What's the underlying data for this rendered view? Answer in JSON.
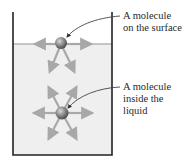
{
  "figure": {
    "labels": {
      "surface": {
        "line1": "A molecule",
        "line2": "on the surface"
      },
      "inside": {
        "line1": "A molecule",
        "line2": "inside the",
        "line3": "liquid"
      }
    },
    "colors": {
      "liquid": "#efefef",
      "beaker": "#222222",
      "arrow": "#a8a8a8",
      "molecule": "#7a7a7a",
      "leader": "#444444"
    }
  }
}
